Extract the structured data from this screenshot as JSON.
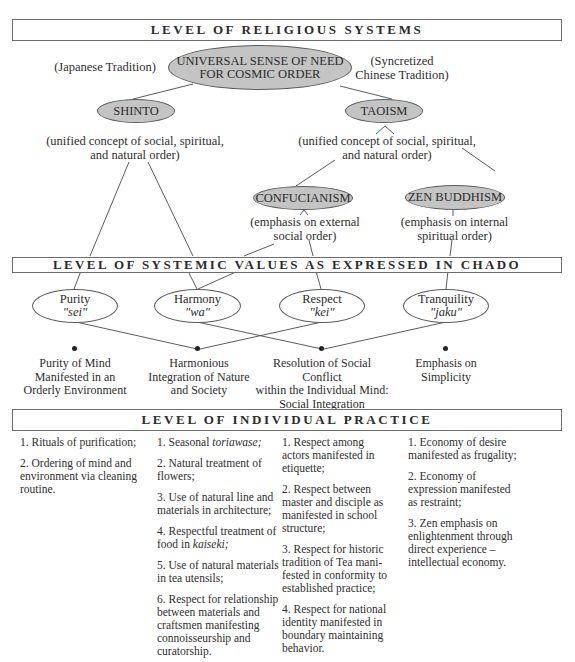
{
  "levels": {
    "religious": "LEVEL OF RELIGIOUS SYSTEMS",
    "values": "LEVEL OF SYSTEMIC VALUES AS EXPRESSED IN CHADO",
    "practice": "LEVEL OF INDIVIDUAL PRACTICE"
  },
  "religious": {
    "root": {
      "line1": "UNIVERSAL SENSE OF NEED",
      "line2": "FOR COSMIC ORDER"
    },
    "left_tradition": "(Japanese Tradition)",
    "right_tradition": {
      "line1": "(Syncretized",
      "line2": "Chinese Tradition)"
    },
    "shinto": {
      "label": "SHINTO",
      "note_line1": "(unified concept of social, spiritual,",
      "note_line2": "and natural order)"
    },
    "taoism": {
      "label": "TAOISM",
      "note_line1": "(unified concept of social, spiritual,",
      "note_line2": "and natural order)"
    },
    "confucianism": {
      "label": "CONFUCIANISM",
      "note_line1": "(emphasis on external",
      "note_line2": "social order)"
    },
    "zen": {
      "label": "ZEN BUDDHISM",
      "note_line1": "(emphasis on internal",
      "note_line2": "spiritual order)"
    }
  },
  "values": [
    {
      "name": "Purity",
      "japanese": "\"sei\"",
      "outcome": [
        "Purity of Mind",
        "Manifested in an",
        "Orderly Environment"
      ]
    },
    {
      "name": "Harmony",
      "japanese": "\"wa\"",
      "outcome": [
        "Harmonious",
        "Integration of Nature",
        "and Society"
      ]
    },
    {
      "name": "Respect",
      "japanese": "\"kei\"",
      "outcome": [
        "Resolution of Social Conflict",
        "within the Individual Mind:",
        "Social Integration"
      ]
    },
    {
      "name": "Tranquility",
      "japanese": "\"jaku\"",
      "outcome": [
        "Emphasis on",
        "Simplicity"
      ]
    }
  ],
  "practice": {
    "purity": [
      "1. Rituals of purification;",
      "2. Ordering of mind and environment via cleaning routine."
    ],
    "harmony": [
      {
        "pre": "1. Seasonal ",
        "em": "toriawase;",
        "post": ""
      },
      {
        "pre": "2. Natural treatment of flowers;",
        "em": "",
        "post": ""
      },
      {
        "pre": "3. Use of natural line and materials in architecture;",
        "em": "",
        "post": ""
      },
      {
        "pre": "4. Respectful treatment of food in ",
        "em": "kaiseki;",
        "post": ""
      },
      {
        "pre": "5. Use of natural materials in tea utensils;",
        "em": "",
        "post": ""
      },
      {
        "pre": "6. Respect for relationship between materials and craftsmen manifesting connoisseurship and curatorship.",
        "em": "",
        "post": ""
      }
    ],
    "respect": [
      "1. Respect among actors manifested in etiquette;",
      "2. Respect between master and disciple as manifested in school structure;",
      "3. Respect for historic tradition of Tea mani-fested in conformity to established practice;",
      "4. Respect for national identity manifested in boundary maintaining behavior."
    ],
    "tranquility": [
      "1. Economy of desire manifested as frugality;",
      "2. Economy of expression manifested as restraint;",
      "3. Zen emphasis on enlightenment through direct experience – intellectual economy."
    ]
  },
  "colors": {
    "ellipse_fill": "#c4c4c4",
    "line": "#4a4a4a",
    "border": "#6d6d6d"
  }
}
